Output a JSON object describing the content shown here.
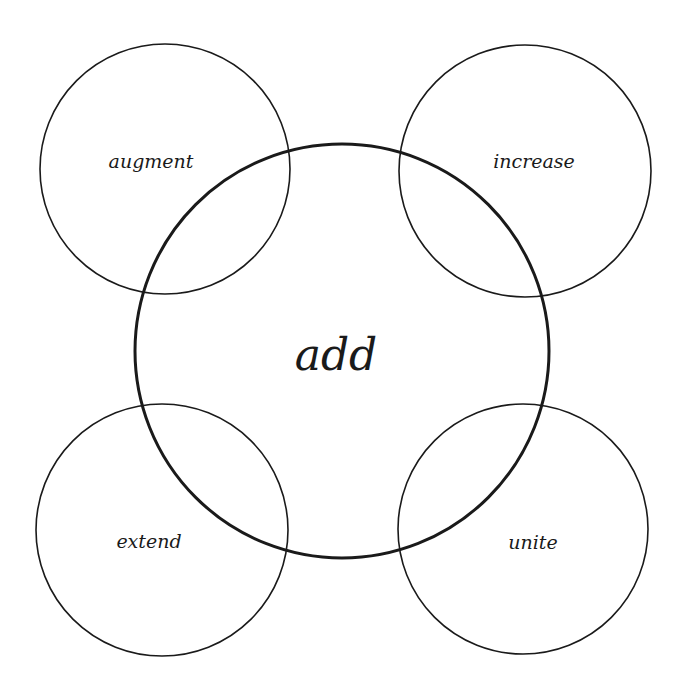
{
  "diagram": {
    "type": "concept-map",
    "center": {
      "label": "add",
      "cx": 342,
      "cy": 351,
      "r": 207
    },
    "satellites": [
      {
        "id": "augment",
        "label": "augment",
        "cx": 165,
        "cy": 169,
        "r": 125,
        "text_x": 151,
        "text_y": 168
      },
      {
        "id": "increase",
        "label": "increase",
        "cx": 525,
        "cy": 171,
        "r": 126,
        "text_x": 534,
        "text_y": 168
      },
      {
        "id": "extend",
        "label": "extend",
        "cx": 162,
        "cy": 530,
        "r": 126,
        "text_x": 149,
        "text_y": 548
      },
      {
        "id": "unite",
        "label": "unite",
        "cx": 523,
        "cy": 529,
        "r": 125,
        "text_x": 533,
        "text_y": 549
      }
    ],
    "colors": {
      "stroke": "#1a1a1a",
      "text": "#1a1a1a",
      "background": "#ffffff"
    }
  }
}
